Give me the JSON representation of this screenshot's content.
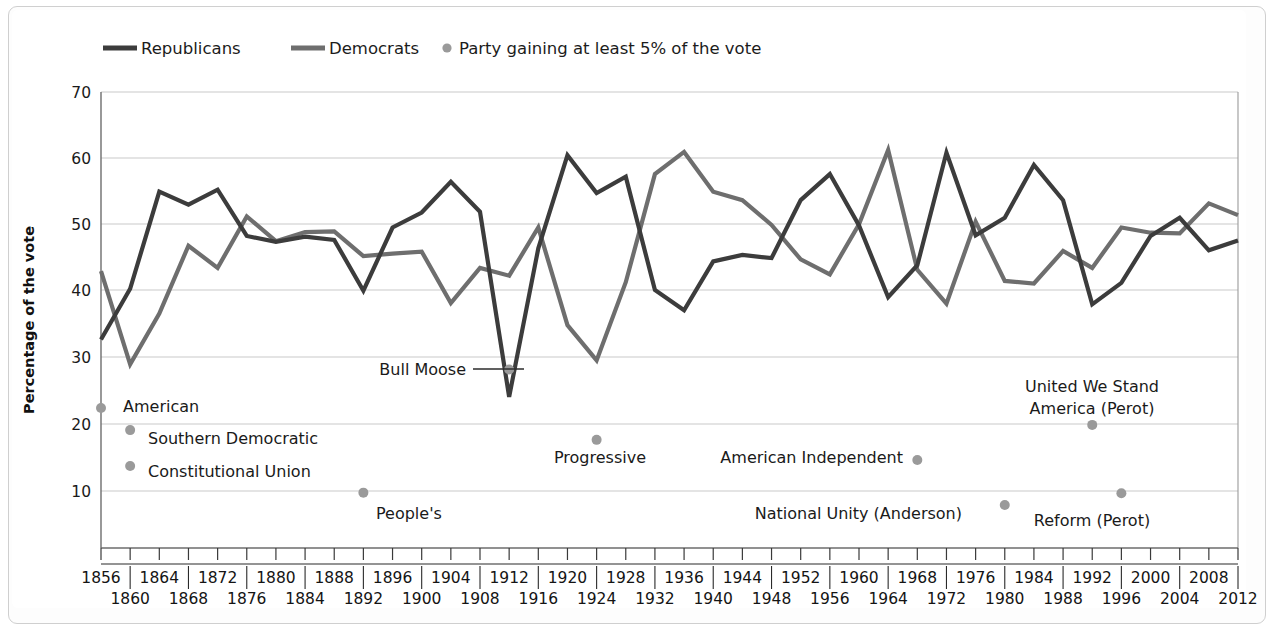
{
  "chart_data": {
    "type": "line",
    "title": "",
    "xlabel": "",
    "ylabel": "Percentage of the vote",
    "ylim": [
      0,
      70
    ],
    "yticks": [
      10,
      20,
      30,
      40,
      50,
      60,
      70
    ],
    "grid": true,
    "legend_position": "top-left",
    "x": [
      1856,
      1860,
      1864,
      1868,
      1872,
      1876,
      1880,
      1884,
      1888,
      1892,
      1896,
      1900,
      1904,
      1908,
      1912,
      1916,
      1920,
      1924,
      1928,
      1932,
      1936,
      1940,
      1944,
      1948,
      1952,
      1956,
      1960,
      1964,
      1968,
      1972,
      1976,
      1980,
      1984,
      1988,
      1992,
      1996,
      2000,
      2004,
      2008,
      2012
    ],
    "categories": [
      "1856",
      "1860",
      "1864",
      "1868",
      "1872",
      "1876",
      "1880",
      "1884",
      "1888",
      "1892",
      "1896",
      "1900",
      "1904",
      "1908",
      "1912",
      "1916",
      "1920",
      "1924",
      "1928",
      "1932",
      "1936",
      "1940",
      "1944",
      "1948",
      "1952",
      "1956",
      "1960",
      "1964",
      "1968",
      "1972",
      "1976",
      "1980",
      "1984",
      "1988",
      "1992",
      "1996",
      "2000",
      "2004",
      "2008",
      "2012"
    ],
    "series": [
      {
        "name": "Republicans",
        "color": "#3c3c3c",
        "values": [
          32.0,
          39.8,
          54.7,
          52.7,
          55.0,
          47.9,
          47.0,
          47.8,
          47.3,
          39.5,
          49.2,
          51.5,
          56.2,
          51.6,
          23.2,
          46.0,
          60.3,
          54.5,
          57.0,
          39.6,
          36.5,
          44.0,
          45.0,
          44.5,
          53.4,
          57.4,
          49.5,
          38.5,
          43.4,
          60.7,
          48.0,
          50.7,
          58.8,
          53.4,
          37.4,
          40.7,
          47.9,
          50.7,
          45.7,
          47.2
        ]
      },
      {
        "name": "Democrats",
        "color": "#6e6e6e",
        "values": [
          42.5,
          28.2,
          36.0,
          46.4,
          43.0,
          50.9,
          47.1,
          48.5,
          48.6,
          44.8,
          45.2,
          45.5,
          37.6,
          43.0,
          41.8,
          49.2,
          34.2,
          28.8,
          40.8,
          57.4,
          60.8,
          54.7,
          53.4,
          49.6,
          44.3,
          42.0,
          49.7,
          61.1,
          42.7,
          37.5,
          50.1,
          41.0,
          40.6,
          45.6,
          43.0,
          49.2,
          48.4,
          48.3,
          52.9,
          51.1
        ]
      }
    ],
    "third_party_points": [
      {
        "label": "American",
        "year": 1856,
        "value": 21.5,
        "label_side": "right"
      },
      {
        "label": "Southern Democratic",
        "year": 1860,
        "value": 18.1,
        "label_side": "right"
      },
      {
        "label": "Constitutional Union",
        "year": 1860,
        "value": 12.6,
        "label_side": "right"
      },
      {
        "label": "People's",
        "year": 1892,
        "value": 8.5,
        "label_side": "right"
      },
      {
        "label": "Bull Moose",
        "year": 1912,
        "value": 27.4,
        "label_side": "left-leader"
      },
      {
        "label": "Progressive",
        "year": 1924,
        "value": 16.6,
        "label_side": "below"
      },
      {
        "label": "American Independent",
        "year": 1968,
        "value": 13.5,
        "label_side": "left"
      },
      {
        "label": "National Unity (Anderson)",
        "year": 1980,
        "value": 6.6,
        "label_side": "left"
      },
      {
        "label": "United We Stand America (Perot)",
        "year": 1992,
        "value": 18.9,
        "label_side": "above"
      },
      {
        "label": "Reform (Perot)",
        "year": 1996,
        "value": 8.4,
        "label_side": "below"
      }
    ]
  },
  "legend": {
    "items": [
      {
        "label": "Republicans",
        "marker": "line",
        "color": "#3c3c3c"
      },
      {
        "label": "Democrats",
        "marker": "line",
        "color": "#6e6e6e"
      },
      {
        "label": "Party gaining at least 5% of the vote",
        "marker": "dot",
        "color": "#9a9a9a"
      }
    ]
  },
  "axes": {
    "y_axis_title": "Percentage of the vote",
    "y_tick_labels": [
      "70",
      "60",
      "50",
      "40",
      "30",
      "20",
      "10"
    ],
    "x_tick_labels_upper": [
      "1856",
      "1864",
      "1872",
      "1880",
      "1888",
      "1896",
      "1904",
      "1912",
      "1920",
      "1928",
      "1936",
      "1944",
      "1952",
      "1960",
      "1968",
      "1976",
      "1984",
      "1992",
      "2000",
      "2008"
    ],
    "x_tick_labels_lower": [
      "1860",
      "1868",
      "1876",
      "1884",
      "1892",
      "1900",
      "1908",
      "1916",
      "1924",
      "1932",
      "1940",
      "1948",
      "1956",
      "1964",
      "1972",
      "1980",
      "1988",
      "1996",
      "2004",
      "2012"
    ]
  },
  "annotations": {
    "bull_moose": "Bull Moose",
    "progressive": "Progressive",
    "american": "American",
    "southern_democratic": "Southern Democratic",
    "constitutional_union": "Constitutional Union",
    "peoples": "People's",
    "american_independent": "American Independent",
    "national_unity": "National Unity (Anderson)",
    "united_we_stand_line1": "United We Stand",
    "united_we_stand_line2": "America (Perot)",
    "reform_perot": "Reform (Perot)"
  }
}
